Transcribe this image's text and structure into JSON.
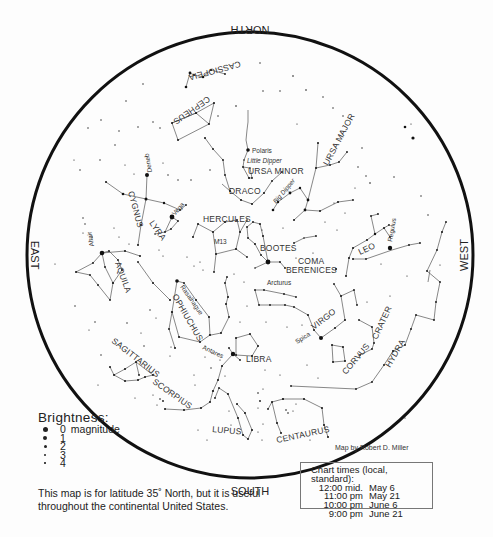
{
  "directions": {
    "north": "NORTH",
    "south": "SOUTH",
    "east": "EAST",
    "west": "WEST"
  },
  "constellations": {
    "cassiopeia": "CASSIOPEIA",
    "cepheus": "CEPHEUS",
    "ursa_minor": "URSA MINOR",
    "little_dipper": "Little Dipper",
    "ursa_major": "URSA MAJOR",
    "big_dipper": "Big Dipper",
    "draco": "DRACO",
    "cygnus": "CYGNUS",
    "lyra": "LYRA",
    "hercules": "HERCULES",
    "m13": "M13",
    "bootes": "BOOTES",
    "coma_1": "COMA",
    "coma_2": "BERENICES",
    "leo": "LEO",
    "aquila": "AQUILA",
    "ophiuchus": "OPHIUCHUS",
    "virgo": "VIRGO",
    "crater": "CRATER",
    "corvus": "CORVUS",
    "hydra": "HYDRA",
    "libra": "LIBRA",
    "sagittarius": "SAGITTARIUS",
    "scorpius": "SCORPIUS",
    "lupus": "LUPUS",
    "centaurus": "CENTAURUS"
  },
  "stars": {
    "polaris": "Polaris",
    "deneb": "Deneb",
    "vega": "Vega",
    "altair": "Altair",
    "arcturus": "Arcturus",
    "regulus": "Regulus",
    "rasalhague": "Rasalhague",
    "spica": "Spica",
    "antares": "Antares"
  },
  "legend": {
    "title": "Brightness:",
    "rows": [
      {
        "value": "0",
        "suffix": "magnitude",
        "size": 5
      },
      {
        "value": "1",
        "suffix": "",
        "size": 4
      },
      {
        "value": "2",
        "suffix": "",
        "size": 3
      },
      {
        "value": "3",
        "suffix": "",
        "size": 2.2
      },
      {
        "value": "4",
        "suffix": "",
        "size": 1.6
      }
    ]
  },
  "note": "This map is for latitude 35˚ North, but it is useful throughout the continental United States.",
  "credit": "Map by Robert D. Miller",
  "chart_times": {
    "header": "Chart times (local, standard):",
    "rows": [
      {
        "time": "12:00 mid.",
        "date": "May 6"
      },
      {
        "time": "11:00 pm",
        "date": "May 21"
      },
      {
        "time": "10:00 pm",
        "date": "June 6"
      },
      {
        "time": "9:00 pm",
        "date": "June 21"
      }
    ]
  }
}
